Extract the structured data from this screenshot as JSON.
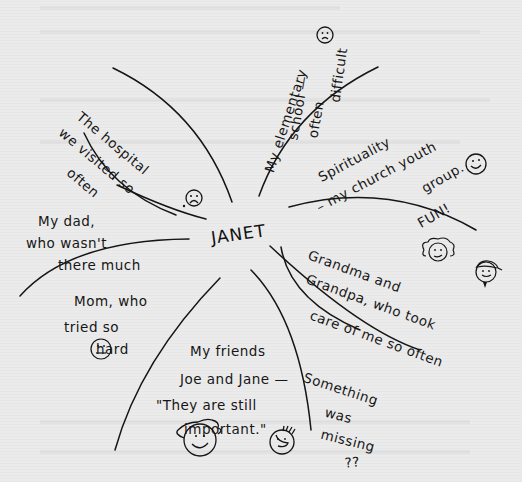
{
  "diagram": {
    "type": "mind-map",
    "style": "hand-drawn",
    "center": {
      "label": "JANET"
    },
    "branches": [
      {
        "id": "hospital",
        "lines": [
          "The hospital",
          "we visited so",
          "often"
        ],
        "icon": "sad-face-icon"
      },
      {
        "id": "school",
        "lines": [
          "My elementary",
          "school —",
          "often",
          "difficult"
        ],
        "icon": "sad-face-icon"
      },
      {
        "id": "spirituality",
        "lines": [
          "Spirituality",
          "– my church youth",
          "group.",
          "FUN!"
        ],
        "icon": "smiley-face-icon"
      },
      {
        "id": "grandparents",
        "lines": [
          "Grandma and",
          "Grandpa, who took",
          "care of me so often"
        ],
        "icons": [
          "grandma-face-icon",
          "grandpa-face-icon"
        ]
      },
      {
        "id": "missing",
        "lines": [
          "Something",
          "was",
          "missing",
          "??"
        ]
      },
      {
        "id": "friends",
        "lines": [
          "My friends",
          "Joe and Jane —",
          "\"They are still",
          "important.\""
        ],
        "icons": [
          "jane-face-icon",
          "joe-face-icon"
        ]
      },
      {
        "id": "mom",
        "lines": [
          "Mom, who",
          "tried so",
          "hard"
        ],
        "icon": "neutral-face-icon"
      },
      {
        "id": "dad",
        "lines": [
          "My dad,",
          "who wasn't",
          "there much"
        ]
      }
    ]
  },
  "colors": {
    "paper": "#ebebeb",
    "ink": "#161616"
  }
}
